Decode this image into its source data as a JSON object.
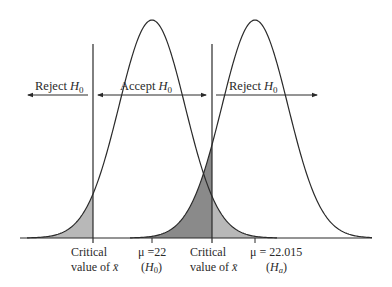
{
  "diagram": {
    "type": "hypothesis-test-two-normal-curves",
    "colors": {
      "stroke": "#2a2a2a",
      "alpha_fill": "#b8b8b8",
      "beta_fill": "#8a8a8a",
      "background": "#ffffff"
    },
    "region_labels": {
      "left_reject": "Reject ",
      "accept": "Accept ",
      "right_reject": "Reject ",
      "h0_symbol": "H",
      "h0_sub": "0"
    },
    "bottom_labels": {
      "crit_left_line1": "Critical",
      "crit_left_line2": "value of ",
      "crit_right_line1": "Critical",
      "crit_right_line2": "value of ",
      "xbar": "x̄",
      "mu_h0_value": "μ =22",
      "mu_h0_hyp_open": "(",
      "mu_h0_hyp_sym": "H",
      "mu_h0_hyp_sub": "0",
      "mu_h0_hyp_close": ")",
      "mu_ha_value": "μ = 22.015",
      "mu_ha_hyp_open": "(",
      "mu_ha_hyp_sym": "H",
      "mu_ha_hyp_sub": "a",
      "mu_ha_hyp_close": ")"
    },
    "curves": [
      {
        "name": "H0 distribution",
        "mean_label": "μ = 22",
        "peak_x": 152
      },
      {
        "name": "Ha distribution",
        "mean_label": "μ = 22.015",
        "peak_x": 255
      }
    ],
    "critical_lines_x": [
      93,
      212
    ]
  }
}
